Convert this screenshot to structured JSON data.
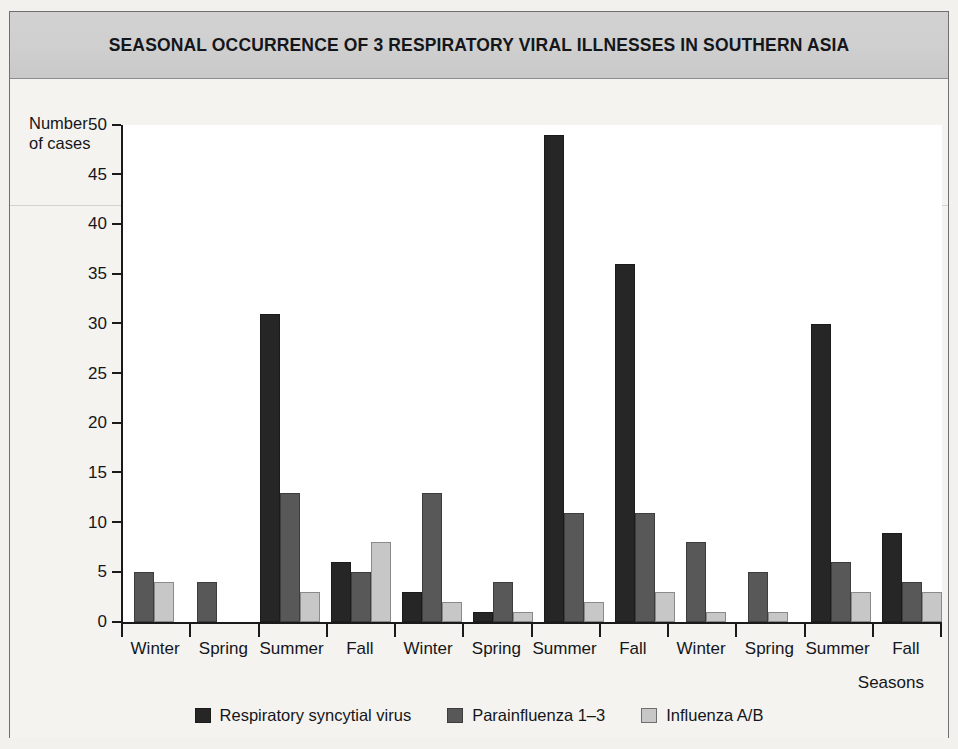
{
  "chart_data": {
    "type": "bar",
    "title": "SEASONAL OCCURRENCE OF 3 RESPIRATORY VIRAL ILLNESSES IN SOUTHERN ASIA",
    "xlabel": "Seasons",
    "ylabel": "Number\nof cases",
    "ylabel_line1": "Number",
    "ylabel_line2": "of cases",
    "ylim": [
      0,
      50
    ],
    "ytick_step": 5,
    "yticks": [
      50,
      45,
      40,
      35,
      30,
      25,
      20,
      15,
      10,
      5,
      0
    ],
    "grid": false,
    "legend_position": "bottom-center",
    "categories": [
      "Winter",
      "Spring",
      "Summer",
      "Fall",
      "Winter",
      "Spring",
      "Summer",
      "Fall",
      "Winter",
      "Spring",
      "Summer",
      "Fall"
    ],
    "series": [
      {
        "name": "Respiratory syncytial virus",
        "color": "#262626",
        "values": [
          0,
          0,
          31,
          6,
          3,
          1,
          49,
          36,
          0,
          0,
          30,
          9
        ]
      },
      {
        "name": "Parainfluenza 1–3",
        "color": "#585858",
        "values": [
          5,
          4,
          13,
          5,
          13,
          4,
          11,
          11,
          8,
          5,
          6,
          4
        ]
      },
      {
        "name": "Influenza A/B",
        "color": "#c7c7c7",
        "values": [
          4,
          0,
          3,
          8,
          2,
          1,
          2,
          3,
          1,
          1,
          3,
          3
        ]
      }
    ]
  }
}
